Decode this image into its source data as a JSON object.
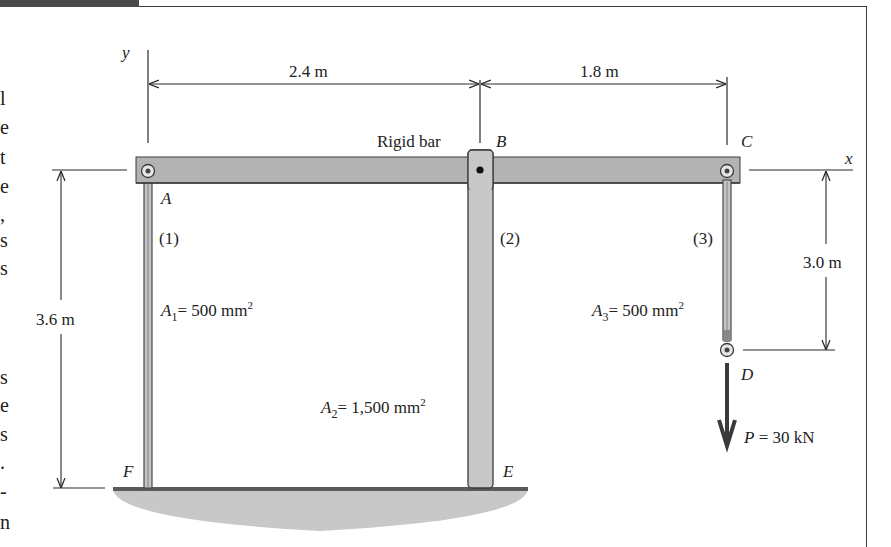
{
  "figure": {
    "header_tab": "",
    "left_edge_glyphs": [
      "l",
      "e",
      "t",
      "e",
      ",",
      "s",
      "s",
      "s",
      "e",
      "s",
      ".",
      "-",
      "n"
    ],
    "axes": {
      "y_label": "y",
      "x_label": "x"
    },
    "dimensions": {
      "ab_span": "2.4 m",
      "bc_span": "1.8 m",
      "bar_height": "3.6 m",
      "rod3_length": "3.0 m"
    },
    "rigid_bar_label": "Rigid bar",
    "points": {
      "A": "A",
      "B": "B",
      "C": "C",
      "D": "D",
      "E": "E",
      "F": "F"
    },
    "members": [
      {
        "id": "(1)",
        "area_symbol": "A",
        "area_sub": "1",
        "area_value": "= 500 mm",
        "area_exp": "2"
      },
      {
        "id": "(2)",
        "area_symbol": "A",
        "area_sub": "2",
        "area_value": "= 1,500 mm",
        "area_exp": "2"
      },
      {
        "id": "(3)",
        "area_symbol": "A",
        "area_sub": "3",
        "area_value": "= 500 mm",
        "area_exp": "2"
      }
    ],
    "load": {
      "symbol": "P",
      "value": "= 30 kN"
    },
    "colors": {
      "bar_fill": "#b3b3b3",
      "member_fill": "#c4c4c4",
      "ground_fill": "#c8c8c8",
      "line": "#2a2a2a",
      "load_arrow": "#3a3a3a"
    }
  }
}
